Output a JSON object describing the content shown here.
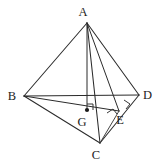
{
  "figure": {
    "kind": "geometry-diagram",
    "background_color": "#ffffff",
    "stroke_color": "#2b2b2b",
    "label_color": "#1c1c1c",
    "canvas": {
      "width": 155,
      "height": 164
    },
    "points": [
      {
        "id": "A",
        "label": "A",
        "x": 87,
        "y": 23,
        "label_x": 83,
        "label_y": 16,
        "marked_dot": false
      },
      {
        "id": "B",
        "label": "B",
        "x": 24,
        "y": 96,
        "label_x": 12,
        "label_y": 100,
        "marked_dot": false
      },
      {
        "id": "C",
        "label": "C",
        "x": 100,
        "y": 143,
        "label_x": 96,
        "label_y": 159,
        "marked_dot": false
      },
      {
        "id": "D",
        "label": "D",
        "x": 139,
        "y": 95,
        "label_x": 143,
        "label_y": 99,
        "marked_dot": false
      },
      {
        "id": "E",
        "label": "E",
        "x": 119,
        "y": 111,
        "label_x": 120,
        "label_y": 124,
        "marked_dot": false
      },
      {
        "id": "G",
        "label": "G",
        "x": 87,
        "y": 110,
        "label_x": 82,
        "label_y": 126,
        "marked_dot": true
      }
    ],
    "segments": [
      {
        "id": "AB",
        "from": "A",
        "to": "B",
        "style": "edge"
      },
      {
        "id": "AD",
        "from": "A",
        "to": "D",
        "style": "edge"
      },
      {
        "id": "AC",
        "from": "A",
        "to": "C",
        "style": "edge"
      },
      {
        "id": "AE",
        "from": "A",
        "to": "E",
        "style": "cevian"
      },
      {
        "id": "AG",
        "from": "A",
        "to": "G",
        "style": "cevian"
      },
      {
        "id": "BD",
        "from": "B",
        "to": "D",
        "style": "edge"
      },
      {
        "id": "BC",
        "from": "B",
        "to": "C",
        "style": "edge"
      },
      {
        "id": "BE",
        "from": "B",
        "to": "E",
        "style": "cevian"
      },
      {
        "id": "CD",
        "from": "C",
        "to": "D",
        "style": "edge"
      },
      {
        "id": "CE",
        "from": "C",
        "to": "E",
        "style": "cevian"
      }
    ],
    "right_angle_marks": [
      {
        "id": "ra-G",
        "at": "G",
        "note": "AG perpendicular to plane BCD",
        "points": "87,104 93,104 93,110"
      },
      {
        "id": "ra-E1",
        "at": "E",
        "note": "AE perpendicular to CD",
        "points": "124,100 130,104 126,109"
      },
      {
        "id": "ra-E2",
        "at": "E",
        "note": "BE perpendicular to CD",
        "points": "107,113 113,109 117,114"
      }
    ]
  }
}
